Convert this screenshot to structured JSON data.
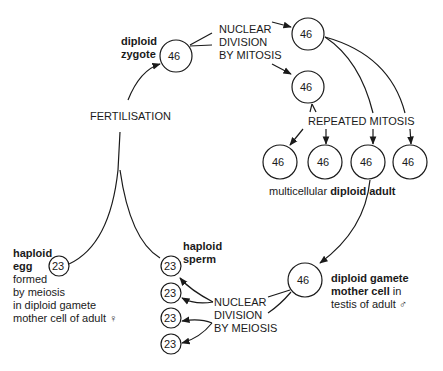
{
  "cells": {
    "zygote": "46",
    "mitosis_top": "46",
    "mitosis_mid": "46",
    "adult_1": "46",
    "adult_2": "46",
    "adult_3": "46",
    "adult_4": "46",
    "gamete_mother": "46",
    "egg": "23",
    "sperm_1": "23",
    "sperm_2": "23",
    "sperm_3": "23",
    "sperm_4": "23"
  },
  "labels": {
    "zygote_bold_1": "diploid",
    "zygote_bold_2": "zygote",
    "mitosis_1": "NUCLEAR",
    "mitosis_2": "DIVISION",
    "mitosis_3": "BY MITOSIS",
    "fertilisation": "FERTILISATION",
    "repeated_mitosis": "REPEATED MITOSIS",
    "adult_plain": "multicellular",
    "adult_bold_1": "diploid",
    "adult_bold_2": "adult",
    "egg_bold_1": "haploid",
    "egg_bold_2": "egg",
    "egg_1": "formed",
    "egg_2": "by meiosis",
    "egg_3": "in diploid gamete",
    "egg_4": "mother cell of adult ♀",
    "sperm_bold_1": "haploid",
    "sperm_bold_2": "sperm",
    "meiosis_1": "NUCLEAR",
    "meiosis_2": "DIVISION",
    "meiosis_3": "BY MEIOSIS",
    "gmc_bold_1": "diploid gamete",
    "gmc_bold_2": "mother cell",
    "gmc_plain_2": " in",
    "gmc_3": "testis of adult ♂"
  }
}
